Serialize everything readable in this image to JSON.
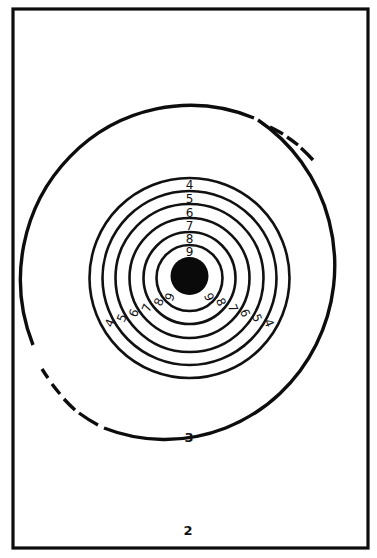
{
  "figure": {
    "type": "shooting-target",
    "colors": {
      "ink": "#111111",
      "paper": "#ffffff",
      "bull": "#0a0a0a"
    },
    "outer_ring_label": "3",
    "plate_number": "2",
    "rings": [
      {
        "score": "4",
        "radius": 100
      },
      {
        "score": "5",
        "radius": 87
      },
      {
        "score": "6",
        "radius": 74
      },
      {
        "score": "7",
        "radius": 60
      },
      {
        "score": "8",
        "radius": 46
      },
      {
        "score": "9",
        "radius": 33
      }
    ],
    "top_labels": [
      "4",
      "5",
      "6",
      "7",
      "8",
      "9"
    ],
    "left_diagonal_labels": [
      "4",
      "5",
      "6",
      "7",
      "8",
      "9"
    ],
    "right_diagonal_labels": [
      "9",
      "8",
      "7",
      "6",
      "5",
      "4"
    ],
    "bull": {
      "label": "bullseye",
      "radius": 19
    }
  }
}
